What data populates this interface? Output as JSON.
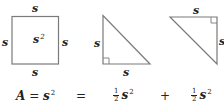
{
  "colors": {
    "line": "#7a7a7a",
    "text": "#222222",
    "background": "#ffffff"
  },
  "square": {
    "top_label": "s",
    "bottom_label": "s",
    "left_label": "s",
    "right_label": "s",
    "center_label": "s",
    "center_exponent": "2"
  },
  "triangle_left": {
    "left_label": "s",
    "bottom_label": "s",
    "right_angle": "bottom-left"
  },
  "triangle_right": {
    "top_label": "s",
    "right_label": "s",
    "right_angle": "top-right"
  },
  "equation": {
    "lhs_var": "A",
    "equals1": "=",
    "lhs_s": "s",
    "lhs_exp": "2",
    "equals2": "=",
    "term1_num": "1",
    "term1_den": "2",
    "term1_s": "s",
    "term1_exp": "2",
    "plus": "+",
    "term2_num": "1",
    "term2_den": "2",
    "term2_s": "s",
    "term2_exp": "2"
  }
}
